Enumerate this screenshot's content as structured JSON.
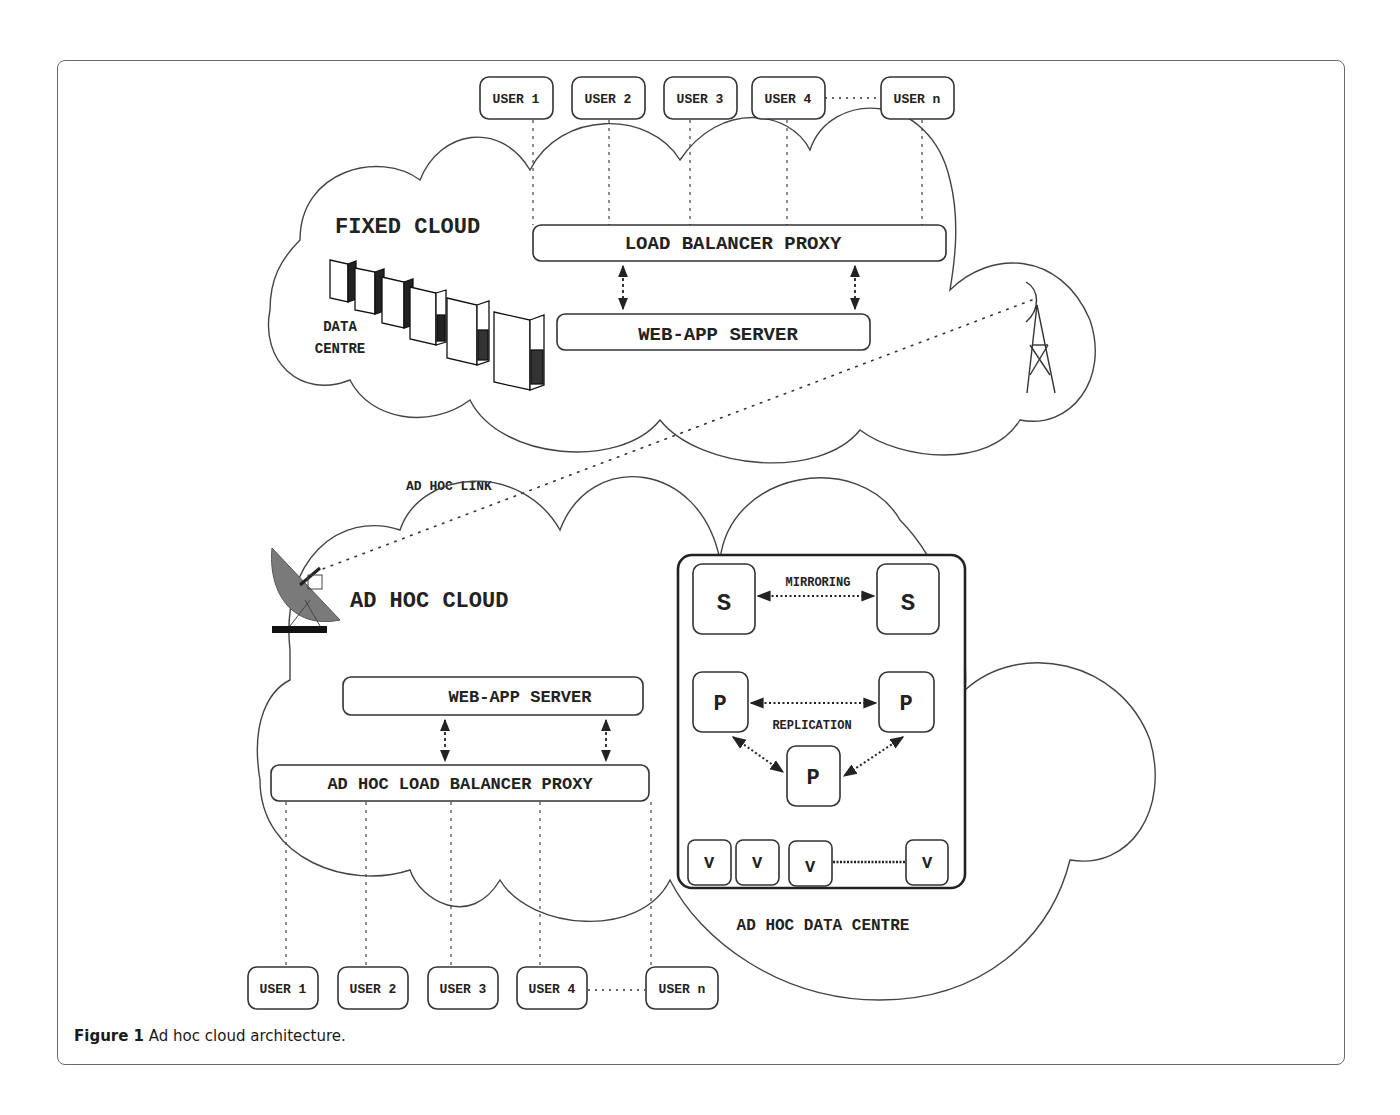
{
  "figure": {
    "caption_label": "Figure 1",
    "caption_text": "Ad hoc cloud architecture."
  },
  "fixed_cloud": {
    "title": "FIXED CLOUD",
    "data_centre_line1": "DATA",
    "data_centre_line2": "CENTRE",
    "load_balancer": "LOAD BALANCER PROXY",
    "web_app_server": "WEB-APP SERVER",
    "users": [
      "USER 1",
      "USER 2",
      "USER 3",
      "USER 4",
      "USER n"
    ]
  },
  "link": {
    "label": "AD HOC LINK"
  },
  "adhoc_cloud": {
    "title": "AD HOC CLOUD",
    "web_app_server": "WEB-APP SERVER",
    "load_balancer": "AD HOC LOAD BALANCER PROXY",
    "users": [
      "USER 1",
      "USER 2",
      "USER 3",
      "USER 4",
      "USER n"
    ]
  },
  "adhoc_data_centre": {
    "title": "AD HOC DATA CENTRE",
    "mirroring_label": "MIRRORING",
    "replication_label": "REPLICATION",
    "storage_nodes": [
      "S",
      "S"
    ],
    "processing_nodes": [
      "P",
      "P",
      "P"
    ],
    "vm_nodes": [
      "V",
      "V",
      "V",
      "V"
    ]
  },
  "colors": {
    "line": "#333333",
    "frame": "#6a6a6a",
    "dish": "#7a7a7a"
  }
}
